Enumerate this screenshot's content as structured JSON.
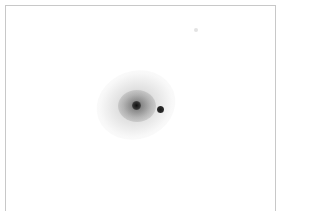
{
  "image": {
    "description": "Grayscale inverted astronomical image of a diffuse galaxy with a compact point source to its right",
    "background_color": "#ffffff",
    "frame_color": "#c8c8c8",
    "objects": [
      {
        "name": "galaxy",
        "center_px": [
          137,
          106
        ],
        "core_color": "#111111"
      },
      {
        "name": "point-source",
        "center_px": [
          161,
          110
        ],
        "color": "#1a1a1a"
      }
    ]
  }
}
